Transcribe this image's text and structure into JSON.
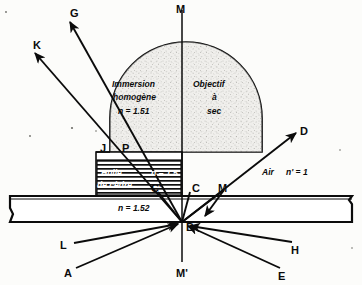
{
  "figure": {
    "type": "optical-ray-diagram",
    "background_color": "#fcfcfa",
    "ink_color": "#0b0b0b"
  },
  "regions": {
    "immersion": {
      "title_line1": "Immersion",
      "title_line2": "homogène",
      "index_label": "n = 1.51"
    },
    "dry": {
      "title_line1": "Objectif",
      "title_line2": "à",
      "title_line3": "sec"
    },
    "oil": {
      "line1": "Huile",
      "line2": "de cèdre",
      "index_label": "n = 1.5"
    },
    "slide": {
      "label": "Lame et lamelle",
      "index_label": "n = 1.52"
    },
    "air": {
      "label": "Air",
      "index_label": "n' = 1"
    }
  },
  "points": [
    {
      "id": "G",
      "label": "G",
      "x": 70,
      "y": 8
    },
    {
      "id": "K",
      "label": "K",
      "x": 33,
      "y": 40
    },
    {
      "id": "M",
      "label": "M",
      "x": 176,
      "y": 4
    },
    {
      "id": "D",
      "label": "D",
      "x": 300,
      "y": 126
    },
    {
      "id": "J",
      "label": "J",
      "x": 100,
      "y": 143
    },
    {
      "id": "P",
      "label": "P",
      "x": 122,
      "y": 143
    },
    {
      "id": "Cp",
      "label": "C'",
      "x": 151,
      "y": 183
    },
    {
      "id": "C",
      "label": "C",
      "x": 192,
      "y": 183
    },
    {
      "id": "M2",
      "label": "M",
      "x": 218,
      "y": 183
    },
    {
      "id": "B",
      "label": "B",
      "x": 186,
      "y": 222
    },
    {
      "id": "H",
      "label": "H",
      "x": 291,
      "y": 245
    },
    {
      "id": "E",
      "label": "E",
      "x": 278,
      "y": 271
    },
    {
      "id": "L",
      "label": "L",
      "x": 60,
      "y": 240
    },
    {
      "id": "A",
      "label": "A",
      "x": 64,
      "y": 268
    },
    {
      "id": "Mp",
      "label": "M'",
      "x": 176,
      "y": 268
    }
  ]
}
